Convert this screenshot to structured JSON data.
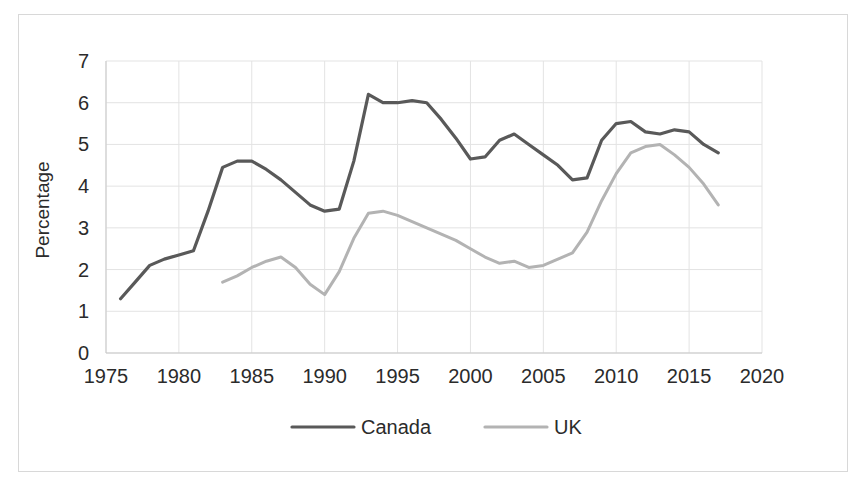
{
  "chart_data": {
    "type": "line",
    "title": "",
    "xlabel": "",
    "ylabel": "Percentage",
    "xlim": [
      1975,
      2020
    ],
    "ylim": [
      0,
      7
    ],
    "xticks": [
      "1975",
      "1980",
      "1985",
      "1990",
      "1995",
      "2000",
      "2005",
      "2010",
      "2015",
      "2020"
    ],
    "yticks": [
      "0",
      "1",
      "2",
      "3",
      "4",
      "5",
      "6",
      "7"
    ],
    "grid": true,
    "legend_position": "bottom",
    "series": [
      {
        "name": "Canada",
        "color": "#595959",
        "x": [
          1976,
          1977,
          1978,
          1979,
          1980,
          1981,
          1982,
          1983,
          1984,
          1985,
          1986,
          1987,
          1988,
          1989,
          1990,
          1991,
          1992,
          1993,
          1994,
          1995,
          1996,
          1997,
          1998,
          1999,
          2000,
          2001,
          2002,
          2003,
          2004,
          2005,
          2006,
          2007,
          2008,
          2009,
          2010,
          2011,
          2012,
          2013,
          2014,
          2015,
          2016,
          2017
        ],
        "values": [
          1.3,
          1.7,
          2.1,
          2.25,
          2.35,
          2.45,
          3.4,
          4.45,
          4.6,
          4.6,
          4.4,
          4.15,
          3.85,
          3.55,
          3.4,
          3.45,
          4.6,
          6.2,
          6.0,
          6.0,
          6.05,
          6.0,
          5.6,
          5.15,
          4.65,
          4.7,
          5.1,
          5.25,
          5.0,
          4.75,
          4.5,
          4.15,
          4.2,
          5.1,
          5.5,
          5.55,
          5.3,
          5.25,
          5.35,
          5.3,
          5.0,
          4.8
        ]
      },
      {
        "name": "UK",
        "color": "#b3b3b3",
        "x": [
          1983,
          1984,
          1985,
          1986,
          1987,
          1988,
          1989,
          1990,
          1991,
          1992,
          1993,
          1994,
          1995,
          1996,
          1997,
          1998,
          1999,
          2000,
          2001,
          2002,
          2003,
          2004,
          2005,
          2006,
          2007,
          2008,
          2009,
          2010,
          2011,
          2012,
          2013,
          2014,
          2015,
          2016,
          2017
        ],
        "values": [
          1.7,
          1.85,
          2.05,
          2.2,
          2.3,
          2.05,
          1.65,
          1.4,
          1.95,
          2.75,
          3.35,
          3.4,
          3.3,
          3.15,
          3.0,
          2.85,
          2.7,
          2.5,
          2.3,
          2.15,
          2.2,
          2.05,
          2.1,
          2.25,
          2.4,
          2.9,
          3.65,
          4.3,
          4.8,
          4.95,
          5.0,
          4.75,
          4.45,
          4.05,
          3.55
        ]
      }
    ]
  },
  "legend": {
    "items": [
      {
        "label": "Canada",
        "color": "#595959"
      },
      {
        "label": "UK",
        "color": "#b3b3b3"
      }
    ]
  }
}
